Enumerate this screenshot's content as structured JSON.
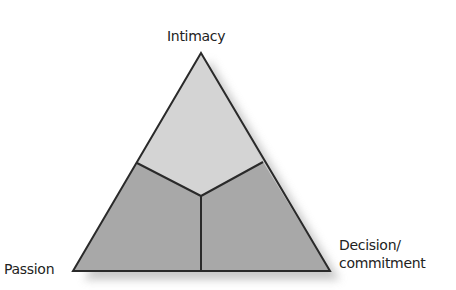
{
  "diagram": {
    "type": "triangular theory of love",
    "vertices": {
      "top": "Intimacy",
      "bottom_left": "Passion",
      "bottom_right_line1": "Decision/",
      "bottom_right_line2": "commitment"
    },
    "colors": {
      "top_region": "#d4d4d4",
      "bottom_regions": "#a8a8a8",
      "stroke": "#2a2a2a",
      "shadow": "#c8c8c8"
    }
  }
}
